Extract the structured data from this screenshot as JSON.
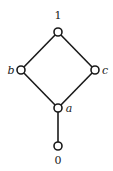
{
  "diagram": {
    "type": "hasse-diagram",
    "nodes": [
      {
        "id": "top",
        "label": "1",
        "x": 58,
        "y": 32,
        "label_x": 58,
        "label_y": 19,
        "italic": false
      },
      {
        "id": "b",
        "label": "b",
        "x": 21,
        "y": 70,
        "label_x": 11,
        "label_y": 74,
        "italic": true
      },
      {
        "id": "c",
        "label": "c",
        "x": 95,
        "y": 70,
        "label_x": 105,
        "label_y": 74,
        "italic": true
      },
      {
        "id": "a",
        "label": "a",
        "x": 58,
        "y": 108,
        "label_x": 69,
        "label_y": 112,
        "italic": true
      },
      {
        "id": "bottom",
        "label": "0",
        "x": 58,
        "y": 146,
        "label_x": 58,
        "label_y": 164,
        "italic": false
      }
    ],
    "edges": [
      {
        "from": "top",
        "to": "b"
      },
      {
        "from": "top",
        "to": "c"
      },
      {
        "from": "b",
        "to": "a"
      },
      {
        "from": "c",
        "to": "a"
      },
      {
        "from": "a",
        "to": "bottom"
      }
    ],
    "colors": {
      "line": "#1a1a1a",
      "node_fill": "#ffffff",
      "background": "#ffffff"
    }
  }
}
